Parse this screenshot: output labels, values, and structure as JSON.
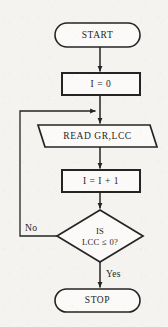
{
  "diagram": {
    "type": "flowchart",
    "title": "",
    "background_color": "#f5f3ef",
    "stroke_color": "#242424",
    "fill_color": "#fbfaf8",
    "nodes": [
      {
        "id": "start",
        "shape": "terminator",
        "label": "START",
        "x": 97.5,
        "y": 35,
        "width": 85,
        "height": 24
      },
      {
        "id": "init",
        "shape": "process",
        "label": "I = 0",
        "x": 101,
        "y": 84,
        "width": 78,
        "height": 22
      },
      {
        "id": "read",
        "shape": "parallelogram",
        "label": "READ GR,LCC",
        "x": 97.5,
        "y": 136,
        "width": 119,
        "height": 22
      },
      {
        "id": "increment",
        "shape": "process",
        "label": "I = I + 1",
        "x": 101,
        "y": 181,
        "width": 78,
        "height": 22
      },
      {
        "id": "decision",
        "shape": "diamond",
        "label_line1": "IS",
        "label_line2": "LCC ≤ 0?",
        "x": 100,
        "y": 236,
        "width": 86,
        "height": 52
      },
      {
        "id": "stop",
        "shape": "terminator",
        "label": "STOP",
        "x": 97.5,
        "y": 300.5,
        "width": 85,
        "height": 23
      }
    ],
    "edges": [
      {
        "id": "start-to-init",
        "from": "start",
        "to": "init",
        "label": "",
        "arrow": true
      },
      {
        "id": "init-to-read",
        "from": "init",
        "to": "read",
        "label": "",
        "arrow": true
      },
      {
        "id": "read-to-increment",
        "from": "read",
        "to": "increment",
        "label": "",
        "arrow": true
      },
      {
        "id": "increment-to-decision",
        "from": "increment",
        "to": "decision",
        "label": "",
        "arrow": true
      },
      {
        "id": "decision-no-loop",
        "from": "decision",
        "to": "read",
        "label": "No",
        "arrow": true
      },
      {
        "id": "decision-yes-to-stop",
        "from": "decision",
        "to": "stop",
        "label": "Yes",
        "arrow": true
      }
    ],
    "branch_labels": {
      "no": "No",
      "yes": "Yes"
    }
  }
}
